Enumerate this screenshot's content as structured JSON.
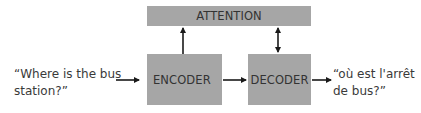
{
  "diagram": {
    "type": "encoder-decoder-attention",
    "nodes": {
      "attention": {
        "label": "ATTENTION"
      },
      "encoder": {
        "label": "ENCODER"
      },
      "decoder": {
        "label": "DECODER"
      }
    },
    "input": {
      "line1": "“Where is the bus",
      "line2": "station?”"
    },
    "output": {
      "line1": "“où est l'arrêt",
      "line2": "de bus?”"
    },
    "edges": [
      {
        "from": "input",
        "to": "encoder",
        "style": "single-arrow"
      },
      {
        "from": "encoder",
        "to": "decoder",
        "style": "single-arrow"
      },
      {
        "from": "encoder",
        "to": "attention",
        "style": "single-arrow"
      },
      {
        "from": "decoder",
        "to": "attention",
        "style": "double-arrow"
      },
      {
        "from": "decoder",
        "to": "output",
        "style": "single-arrow"
      }
    ],
    "colors": {
      "box": "#a6a6a6",
      "text": "#333333",
      "arrow": "#1a1a1a"
    }
  }
}
